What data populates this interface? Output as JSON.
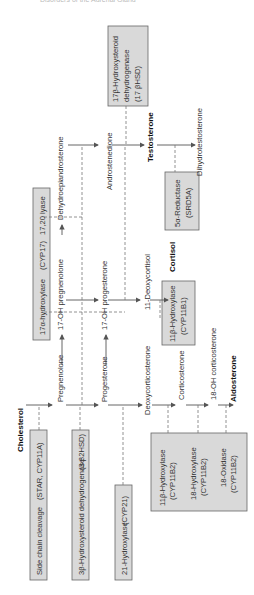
{
  "header": "Disorders of the Adrenal Gland",
  "metabolites": {
    "cholesterol": "Cholesterol",
    "pregnenolone": "Pregnenolone",
    "progesterone": "Progesterone",
    "deoxycorticosterone": "Deoxycorticosterone",
    "corticosterone": "Corticosterone",
    "oh18_corticosterone": "18-OH corticosterone",
    "aldosterone": "Aldosterone",
    "oh17_pregnenolone": "17-OH pregnenolone",
    "dhea": "Dehydroepiandrosterone",
    "oh17_progesterone": "17-OH progesterone",
    "androstenedione": "Androstenedione",
    "deoxycortisol": "11-Deoxycortisol",
    "cortisol": "Cortisol",
    "testosterone": "Testosterone",
    "dht": "Dihydrotestosterone"
  },
  "enzymes": {
    "scc": {
      "name": "Side chain cleavage",
      "gene": "(STAR, CYP11A)"
    },
    "hsd3b": {
      "name": "3β-Hydroxysteroid dehydrogenase",
      "gene": "(3 β2HSD)"
    },
    "cyp21": {
      "name": "21-Hydroxylase",
      "gene": "(CYP21)"
    },
    "cyp17": {
      "name": "17α-hydroxylase",
      "gene": "(CYP17)",
      "lyase": "17,20 lyase"
    },
    "cyp11b1": {
      "name": "11β-Hydroxylase",
      "gene": "(CYP11B1)"
    },
    "cyp11b2_a": {
      "name": "11β-Hydroxylase",
      "gene": "(CYP11B2)"
    },
    "cyp11b2_b": {
      "name": "18-Hydroxylase",
      "gene": "(CYP11B2)"
    },
    "cyp11b2_c": {
      "name": "18-Oxidase",
      "gene": "(CYP11B2)"
    },
    "srd5a": {
      "name": "5α-Reductase",
      "gene": "(SRD5A)"
    },
    "hsd17b": {
      "line1": "17β-Hydroxysteroid",
      "line2": "dehydrogenase",
      "line3": "(17 βHSD)"
    }
  }
}
